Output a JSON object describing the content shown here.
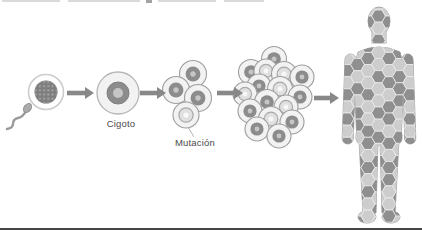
{
  "diagram": {
    "labels": {
      "zygote": "Cigoto",
      "mutation": "Mutación"
    },
    "colors": {
      "background": "#ffffff",
      "arrow": "#888888",
      "cell_body": "#f2f2f2",
      "cell_outline": "#9e9e9e",
      "nucleus_dark": "#8c8c8c",
      "nucleus_dark_center": "#c6c6c6",
      "nucleus_light": "#e0e0e0",
      "nucleus_light_ring": "#a8a8a8",
      "nucleus_light_center": "#f8f8f8",
      "egg_inner": "#7e7e7e",
      "egg_dot": "#a5a5a5",
      "egg_outline": "#cccccc",
      "sperm": "#9a9a9a",
      "label_text": "#4a4a4a",
      "hex_light": "#cdcdcd",
      "hex_dark": "#8f8f8f",
      "hex_gap": "#ececec",
      "body_base": "#d8d8d8",
      "body_outline": "#9c9c9c",
      "bottom_rule": "#454545",
      "pointer_line": "#b0b0b0"
    },
    "egg": {
      "x": 46,
      "y": 92,
      "r_outer": 17.5,
      "r_inner": 11.5
    },
    "zygote": {
      "x": 118,
      "y": 93,
      "r_outer": 21,
      "r_nucleus": 11,
      "r_center": 5
    },
    "four_cell": {
      "cells": [
        {
          "x": 193,
          "y": 74,
          "r": 13.5,
          "type": "dark"
        },
        {
          "x": 176,
          "y": 90,
          "r": 13.5,
          "type": "dark"
        },
        {
          "x": 198,
          "y": 98,
          "r": 13.5,
          "type": "dark"
        },
        {
          "x": 186,
          "y": 115,
          "r": 13,
          "type": "light"
        }
      ],
      "pointer": {
        "x1": 188,
        "y1": 127,
        "x2": 194,
        "y2": 137
      }
    },
    "cluster": {
      "cells": [
        {
          "x": 274,
          "y": 59,
          "r": 12.5,
          "type": "dark"
        },
        {
          "x": 251,
          "y": 72,
          "r": 12.5,
          "type": "dark"
        },
        {
          "x": 266,
          "y": 71,
          "r": 12,
          "type": "light"
        },
        {
          "x": 284,
          "y": 74,
          "r": 12.5,
          "type": "light"
        },
        {
          "x": 302,
          "y": 77,
          "r": 12,
          "type": "dark"
        },
        {
          "x": 259,
          "y": 86,
          "r": 12,
          "type": "dark"
        },
        {
          "x": 280,
          "y": 89,
          "r": 12.5,
          "type": "light"
        },
        {
          "x": 245,
          "y": 94,
          "r": 12,
          "type": "light"
        },
        {
          "x": 300,
          "y": 97,
          "r": 12,
          "type": "dark"
        },
        {
          "x": 267,
          "y": 102,
          "r": 12.5,
          "type": "dark"
        },
        {
          "x": 286,
          "y": 107,
          "r": 12,
          "type": "light"
        },
        {
          "x": 250,
          "y": 111,
          "r": 12,
          "type": "dark"
        },
        {
          "x": 271,
          "y": 119,
          "r": 12.5,
          "type": "light"
        },
        {
          "x": 292,
          "y": 122,
          "r": 12,
          "type": "dark"
        },
        {
          "x": 257,
          "y": 129,
          "r": 12,
          "type": "dark"
        },
        {
          "x": 279,
          "y": 136,
          "r": 12,
          "type": "dark"
        }
      ]
    },
    "arrows": [
      {
        "x1": 67,
        "x2": 94,
        "y": 93
      },
      {
        "x1": 140,
        "x2": 166,
        "y": 93
      },
      {
        "x1": 217,
        "x2": 243,
        "y": 93
      },
      {
        "x1": 314,
        "x2": 339,
        "y": 98
      }
    ],
    "human": {
      "hex_radius": 7,
      "origin_x": 347,
      "origin_y": 10,
      "pattern": [
        "0001000",
        "0010100",
        "0101000",
        "0010010",
        "0110101",
        "1001010",
        "0100110",
        "1010011",
        "0101100",
        "1100101",
        "0011010",
        "1010101",
        "0101011",
        "0110100",
        "1001101",
        "0110010",
        "1001011",
        "0100100"
      ]
    }
  }
}
